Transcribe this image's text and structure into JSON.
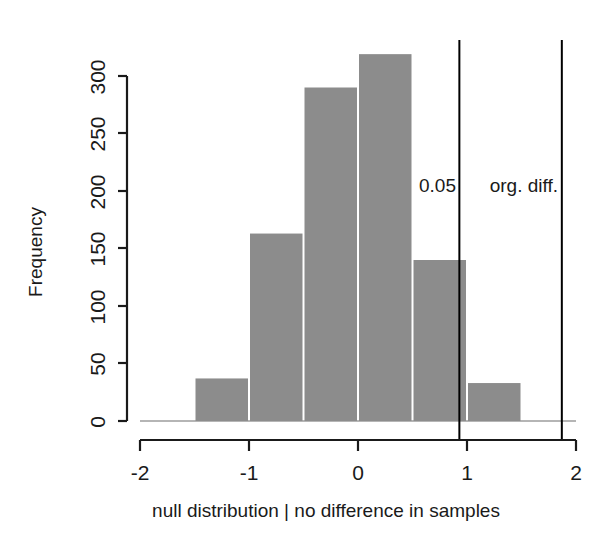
{
  "chart_data": {
    "type": "bar",
    "title": "",
    "subtitle": "",
    "xlabel": "null distribution | no difference in samples",
    "ylabel": "Frequency",
    "xlim": [
      -2,
      2
    ],
    "ylim": [
      0,
      300
    ],
    "grid": false,
    "legend": null,
    "bin_width": 0.5,
    "bin_edges": [
      -1.5,
      -1.0,
      -0.5,
      0.0,
      0.5,
      1.0,
      1.5
    ],
    "categories": [
      "-1.5 to -1",
      "-1 to -0.5",
      "-0.5 to 0",
      "0 to 0.5",
      "0.5 to 1",
      "1 to 1.5"
    ],
    "values": [
      37,
      163,
      290,
      319,
      140,
      33
    ],
    "bar_color": "#8c8c8c",
    "x_ticks": [
      -2,
      -1,
      0,
      1,
      2
    ],
    "x_tick_labels": [
      "-2",
      "-1",
      "0",
      "1",
      "2"
    ],
    "y_ticks": [
      0,
      50,
      100,
      150,
      200,
      250,
      300
    ],
    "y_tick_labels": [
      "0",
      "50",
      "100",
      "150",
      "200",
      "250",
      "300"
    ],
    "annotations": [
      {
        "name": "significance-threshold",
        "label": "0.05",
        "x": 0.93,
        "line_color": "#000000"
      },
      {
        "name": "observed-difference",
        "label": "org. diff.",
        "x": 1.87,
        "line_color": "#000000"
      }
    ]
  }
}
